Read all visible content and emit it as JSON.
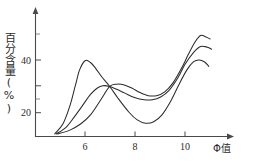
{
  "chart_data": {
    "type": "line",
    "title": "",
    "subtitle": "",
    "xlabel": "Φ值",
    "ylabel": "百分含量(%)",
    "xlim": [
      4.6,
      11.6
    ],
    "ylim": [
      0,
      48
    ],
    "grid": false,
    "legend_position": "none",
    "x_ticks": [
      6,
      8,
      10
    ],
    "x_tick_labels": [
      "6",
      "8",
      "10"
    ],
    "x_minor_ticks": [],
    "y_ticks": [
      20,
      40
    ],
    "y_tick_labels": [
      "20",
      "40"
    ],
    "y_minor_ticks": [
      10,
      30,
      45
    ],
    "annotations": [],
    "crossing_point": {
      "x": 7.3,
      "y": 19.6
    },
    "series": [
      {
        "name": "curve-1",
        "description": "tall early peak, deep trough, moderate late peak",
        "x": [
          5.3,
          5.6,
          5.85,
          6.05,
          6.2,
          6.4,
          6.6,
          6.8,
          7.0,
          7.3,
          7.6,
          8.0,
          8.3,
          8.6,
          8.9,
          9.2,
          9.5,
          9.8,
          10.1,
          10.35,
          10.55,
          10.75,
          10.9
        ],
        "y": [
          1.0,
          5.0,
          12.0,
          20.0,
          26.0,
          29.7,
          29.0,
          26.5,
          23.5,
          19.6,
          15.0,
          9.5,
          6.5,
          5.2,
          5.8,
          8.5,
          13.5,
          20.0,
          26.0,
          29.3,
          30.0,
          29.2,
          27.5
        ]
      },
      {
        "name": "curve-2",
        "description": "medium early peak, shallow trough, high late peak",
        "x": [
          5.35,
          5.7,
          6.0,
          6.3,
          6.6,
          6.85,
          7.05,
          7.3,
          7.55,
          7.85,
          8.2,
          8.55,
          8.85,
          9.15,
          9.45,
          9.75,
          10.05,
          10.35,
          10.6,
          10.85,
          11.0
        ],
        "y": [
          1.0,
          3.5,
          7.5,
          12.0,
          16.5,
          19.0,
          19.9,
          19.6,
          18.5,
          17.0,
          15.3,
          14.4,
          14.4,
          15.5,
          18.0,
          22.5,
          28.5,
          33.0,
          35.3,
          35.0,
          34.2
        ]
      },
      {
        "name": "curve-3",
        "description": "slow rise, broad low peak, highest late peak",
        "x": [
          5.4,
          5.85,
          6.25,
          6.6,
          6.95,
          7.3,
          7.55,
          7.8,
          8.1,
          8.4,
          8.7,
          9.0,
          9.3,
          9.6,
          9.9,
          10.15,
          10.4,
          10.6,
          10.8,
          10.95
        ],
        "y": [
          1.0,
          2.5,
          5.0,
          8.5,
          14.0,
          19.6,
          20.5,
          20.3,
          19.0,
          17.2,
          16.0,
          16.0,
          17.5,
          21.0,
          26.5,
          32.0,
          37.0,
          39.6,
          39.0,
          38.2
        ]
      }
    ]
  },
  "axes": {
    "y_axis_name": "percentage-content-axis",
    "x_axis_name": "phi-value-axis"
  }
}
